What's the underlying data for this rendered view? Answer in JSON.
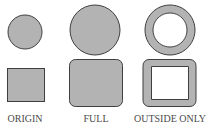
{
  "colors": {
    "fill": "#b3b3b3",
    "stroke": "#4a4a4a",
    "background": "#ffffff",
    "label": "#4a4a4a"
  },
  "panels": [
    {
      "label": "ORIGIN",
      "shape_top": "circle",
      "shape_bottom": "square"
    },
    {
      "label": "FULL",
      "shape_top": "circle",
      "shape_bottom": "rounded-square"
    },
    {
      "label": "OUTSIDE ONLY",
      "shape_top": "ring",
      "shape_bottom": "rounded-square-frame"
    }
  ]
}
